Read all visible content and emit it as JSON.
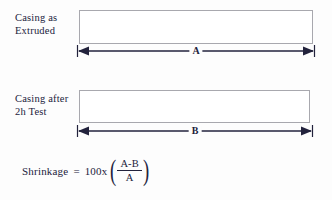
{
  "diagram": {
    "background_color": "#fdfdfd",
    "line_color": "#22223c",
    "box_border_color": "#a8a8ae",
    "box_fill_color": "#ffffff",
    "specimens": [
      {
        "label": "Casing as\nExtruded",
        "label_line1": "Casing as",
        "label_line2": "Extruded",
        "dimension_label": "A"
      },
      {
        "label": "Casing after\n2h Test",
        "label_line1": "Casing after",
        "label_line2": "2h Test",
        "dimension_label": "B"
      }
    ],
    "formula": {
      "name": "Shrinkage",
      "equals": "=",
      "coefficient": "100x",
      "paren_open": "(",
      "paren_close": ")",
      "numerator": "A-B",
      "denominator": "A",
      "full_text": "Shrinkage = 100x((A-B)/A)"
    }
  }
}
